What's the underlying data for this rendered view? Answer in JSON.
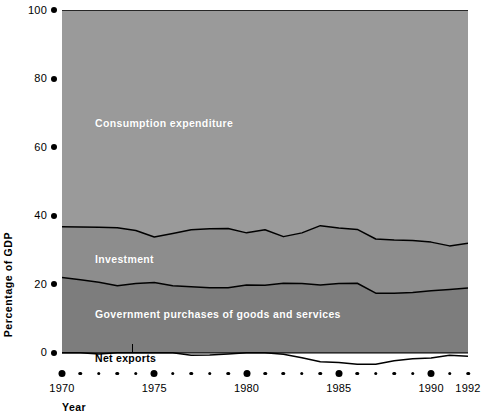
{
  "chart_data": {
    "type": "area",
    "title": "",
    "subtitle": "",
    "xlabel": "Year",
    "ylabel": "Percentage of  GDP",
    "stacked": true,
    "grid": false,
    "legend_position": "inline-band-labels",
    "xlim": [
      1970,
      1992
    ],
    "ylim": [
      -5,
      100
    ],
    "yticks": [
      0,
      20,
      40,
      60,
      80,
      100
    ],
    "ytick_labels": [
      "0",
      "20",
      "40",
      "60",
      "80",
      "100"
    ],
    "xticks": [
      1970,
      1975,
      1980,
      1985,
      1990,
      1992
    ],
    "xtick_labels": [
      "1970",
      "1975",
      "1980",
      "1985",
      "1990",
      "1992"
    ],
    "x": [
      1970,
      1971,
      1972,
      1973,
      1974,
      1975,
      1976,
      1977,
      1978,
      1979,
      1980,
      1981,
      1982,
      1983,
      1984,
      1985,
      1986,
      1987,
      1988,
      1989,
      1990,
      1991,
      1992
    ],
    "series": [
      {
        "name": "Net exports",
        "color": "#ffffff",
        "values": [
          0.2,
          0.1,
          -0.3,
          0.5,
          0.2,
          1.2,
          0.2,
          -0.7,
          -0.6,
          -0.3,
          0.1,
          0.0,
          -0.4,
          -1.4,
          -2.6,
          -2.8,
          -3.3,
          -3.3,
          -2.3,
          -1.7,
          -1.5,
          -0.7,
          -1.0
        ]
      },
      {
        "name": "Government purchases of goods and services",
        "color": "#7d7d7d",
        "values": [
          22.0,
          21.3,
          20.6,
          19.6,
          20.2,
          20.5,
          19.6,
          19.3,
          19.0,
          19.0,
          19.8,
          19.7,
          20.3,
          20.2,
          19.8,
          20.2,
          20.3,
          17.4,
          17.4,
          17.6,
          18.1,
          18.5,
          18.9
        ]
      },
      {
        "name": "Investment",
        "color": "#8d8d8d",
        "values": [
          14.8,
          15.4,
          16.0,
          16.9,
          15.5,
          13.3,
          15.2,
          16.6,
          17.2,
          17.3,
          15.2,
          16.2,
          13.6,
          14.8,
          17.3,
          16.2,
          15.7,
          15.8,
          15.5,
          15.2,
          14.2,
          12.7,
          13.1
        ]
      },
      {
        "name": "Consumption expenditure",
        "color": "#9a9a9a",
        "values": [
          63.0,
          63.2,
          63.7,
          63.0,
          64.1,
          65.0,
          65.0,
          64.8,
          64.4,
          64.0,
          65.0,
          64.1,
          66.5,
          66.4,
          65.5,
          66.4,
          67.3,
          66.1,
          66.4,
          66.4,
          67.2,
          68.1,
          68.0
        ]
      }
    ],
    "boundaries_note": "Bands are plotted cumulatively from 0 upward: government, then investment, then consumption to 100. Net exports is drawn below the zero axis.",
    "annotations": [
      {
        "name": "consumption-label",
        "text": "Consumption expenditure",
        "x": 1972.5,
        "y": 72
      },
      {
        "name": "investment-label",
        "text": "Investment",
        "x": 1972.5,
        "y": 27
      },
      {
        "name": "government-label",
        "text": "Government purchases of goods and services",
        "x": 1972.5,
        "y": 11
      },
      {
        "name": "netexports-label",
        "text": "Net exports",
        "x": 1973.5,
        "y": -4
      }
    ]
  },
  "axes": {
    "y": {
      "title": "Percentage of  GDP",
      "ticks": [
        {
          "label": "100",
          "value": 100
        },
        {
          "label": "80",
          "value": 80
        },
        {
          "label": "60",
          "value": 60
        },
        {
          "label": "40",
          "value": 40
        },
        {
          "label": "20",
          "value": 20
        },
        {
          "label": "0",
          "value": 0
        }
      ]
    },
    "x": {
      "title": "Year",
      "ticks": [
        {
          "label": "1970",
          "value": 1970,
          "major": true
        },
        {
          "label": "",
          "value": 1971,
          "major": false
        },
        {
          "label": "",
          "value": 1972,
          "major": false
        },
        {
          "label": "",
          "value": 1973,
          "major": false
        },
        {
          "label": "",
          "value": 1974,
          "major": false
        },
        {
          "label": "1975",
          "value": 1975,
          "major": true
        },
        {
          "label": "",
          "value": 1976,
          "major": false
        },
        {
          "label": "",
          "value": 1977,
          "major": false
        },
        {
          "label": "",
          "value": 1978,
          "major": false
        },
        {
          "label": "",
          "value": 1979,
          "major": false
        },
        {
          "label": "1980",
          "value": 1980,
          "major": true
        },
        {
          "label": "",
          "value": 1981,
          "major": false
        },
        {
          "label": "",
          "value": 1982,
          "major": false
        },
        {
          "label": "",
          "value": 1983,
          "major": false
        },
        {
          "label": "",
          "value": 1984,
          "major": false
        },
        {
          "label": "1985",
          "value": 1985,
          "major": true
        },
        {
          "label": "",
          "value": 1986,
          "major": false
        },
        {
          "label": "",
          "value": 1987,
          "major": false
        },
        {
          "label": "",
          "value": 1988,
          "major": false
        },
        {
          "label": "",
          "value": 1989,
          "major": false
        },
        {
          "label": "1990",
          "value": 1990,
          "major": true
        },
        {
          "label": "",
          "value": 1991,
          "major": false
        },
        {
          "label": "1992",
          "value": 1992,
          "major": false
        }
      ]
    }
  },
  "labels": {
    "consumption": "Consumption expenditure",
    "investment": "Investment",
    "government": "Government purchases of goods and services",
    "net_exports": "Net exports"
  },
  "colors": {
    "consumption": "#9a9a9a",
    "investment": "#8d8d8d",
    "government": "#7d7d7d",
    "net_exports": "#ffffff",
    "line": "#000000",
    "background": "#ffffff"
  }
}
